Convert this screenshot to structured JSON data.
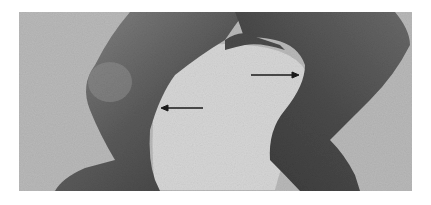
{
  "image": {
    "description": "Grayscale clinical photograph of a child's legs showing bilateral bowing (genu varum) with two annotation arrows",
    "colors": {
      "background": "#ffffff",
      "photo_background": "#b9b9b9",
      "central_gap": "#d6d6d6",
      "leg_light": "#7a7a7a",
      "leg_dark": "#3c3c3c",
      "arrow": "#1a1a1a"
    },
    "annotations": [
      {
        "name": "left-arrow",
        "direction": "left",
        "x1": 203,
        "y1": 108,
        "x2": 161,
        "y2": 108
      },
      {
        "name": "right-arrow",
        "direction": "right",
        "x1": 251,
        "y1": 75,
        "x2": 299,
        "y2": 75
      }
    ]
  }
}
